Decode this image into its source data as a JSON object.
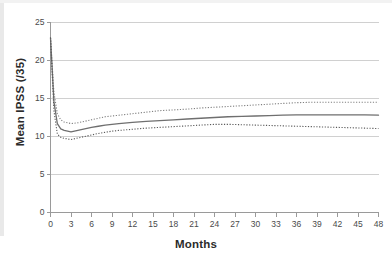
{
  "chart_data": {
    "type": "line",
    "title": "",
    "xlabel": "Months",
    "ylabel": "Mean IPSS (/35)",
    "xlim": [
      0,
      48
    ],
    "ylim": [
      0,
      25
    ],
    "xticks": [
      0,
      3,
      6,
      9,
      12,
      15,
      18,
      21,
      24,
      27,
      30,
      33,
      36,
      39,
      42,
      45,
      48
    ],
    "yticks": [
      0,
      5,
      10,
      15,
      20,
      25
    ],
    "grid": "horizontal",
    "legend": "none",
    "series": [
      {
        "name": "Upper 95% confidence limit",
        "style": "dotted",
        "color": "#808080",
        "x": [
          0,
          0.5,
          1,
          1.5,
          2,
          3,
          4,
          5,
          6,
          7,
          8,
          9,
          10,
          12,
          14,
          16,
          18,
          20,
          22,
          24,
          26,
          28,
          30,
          32,
          34,
          36,
          38,
          40,
          42,
          44,
          46,
          48
        ],
        "y": [
          23.0,
          15.8,
          13.0,
          12.2,
          11.9,
          11.7,
          11.8,
          12.0,
          12.2,
          12.4,
          12.6,
          12.7,
          12.8,
          13.0,
          13.2,
          13.4,
          13.5,
          13.6,
          13.75,
          13.85,
          13.95,
          14.05,
          14.15,
          14.25,
          14.35,
          14.45,
          14.5,
          14.5,
          14.5,
          14.5,
          14.5,
          14.5
        ]
      },
      {
        "name": "Mean IPSS",
        "style": "solid",
        "color": "#6f6f6f",
        "x": [
          0,
          0.5,
          1,
          1.5,
          2,
          3,
          4,
          5,
          6,
          7,
          8,
          9,
          10,
          12,
          14,
          16,
          18,
          20,
          22,
          24,
          26,
          28,
          30,
          32,
          34,
          36,
          38,
          40,
          42,
          44,
          46,
          48
        ],
        "y": [
          23.0,
          14.6,
          11.7,
          11.0,
          10.8,
          10.6,
          10.8,
          11.0,
          11.2,
          11.35,
          11.5,
          11.6,
          11.7,
          11.85,
          12.0,
          12.1,
          12.2,
          12.3,
          12.4,
          12.5,
          12.6,
          12.65,
          12.7,
          12.75,
          12.8,
          12.85,
          12.85,
          12.85,
          12.85,
          12.85,
          12.85,
          12.8
        ]
      },
      {
        "name": "Lower 95% confidence limit",
        "style": "dotted",
        "color": "#5a5a5a",
        "x": [
          0,
          0.5,
          1,
          1.5,
          2,
          3,
          4,
          5,
          6,
          7,
          8,
          9,
          10,
          12,
          14,
          16,
          18,
          20,
          22,
          24,
          26,
          28,
          30,
          32,
          34,
          36,
          38,
          40,
          42,
          44,
          46,
          48
        ],
        "y": [
          23.0,
          13.4,
          10.3,
          9.9,
          9.75,
          9.6,
          9.8,
          10.0,
          10.2,
          10.4,
          10.55,
          10.7,
          10.8,
          10.95,
          11.1,
          11.2,
          11.3,
          11.4,
          11.5,
          11.6,
          11.6,
          11.55,
          11.5,
          11.45,
          11.4,
          11.35,
          11.3,
          11.25,
          11.2,
          11.15,
          11.1,
          11.05
        ]
      }
    ]
  }
}
